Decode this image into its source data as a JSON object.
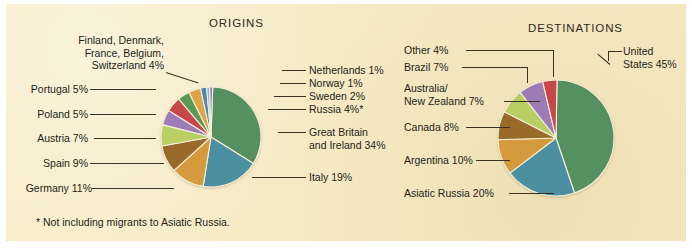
{
  "figure": {
    "background_color": "#f6e9c2",
    "text_color": "#241f18",
    "footnote": "* Not including migrants to Asiatic Russia."
  },
  "panels": {
    "origins": {
      "title": "ORIGINS",
      "labels": {
        "nordic_group": "Finland, Denmark,\nFrance, Belgium,\nSwitzerland  4%",
        "nordic_group_l1": "Finland, Denmark,",
        "nordic_group_l2": "France, Belgium,",
        "nordic_group_l3": "Switzerland  4%",
        "portugal": "Portugal  5%",
        "poland": "Poland  5%",
        "austria": "Austria  7%",
        "spain": "Spain  9%",
        "germany": "Germany  11%",
        "netherlands": "Netherlands  1%",
        "norway": "Norway  1%",
        "sweden": "Sweden  2%",
        "russia": "Russia  4%*",
        "great_britain_l1": "Great Britain",
        "great_britain_l2": "and Ireland  34%",
        "italy": "Italy  19%"
      }
    },
    "destinations": {
      "title": "DESTINATIONS",
      "labels": {
        "other": "Other  4%",
        "brazil": "Brazil  7%",
        "australia_nz_l1": "Australia/",
        "australia_nz_l2": "New Zealand  7%",
        "canada": "Canada  8%",
        "argentina": "Argentina  10%",
        "asiatic_russia": "Asiatic Russia  20%",
        "united_states_l1": "United",
        "united_states_l2": "States 45%"
      }
    }
  },
  "chart_data": [
    {
      "type": "pie",
      "title": "ORIGINS",
      "id": "origins",
      "unit": "percent",
      "legend_position": "leader-lines",
      "note": "* Not including migrants to Asiatic Russia.",
      "categories": [
        "Great Britain and Ireland",
        "Italy",
        "Germany",
        "Spain",
        "Austria",
        "Poland",
        "Portugal",
        "Finland, Denmark, France, Belgium, Switzerland",
        "Russia",
        "Sweden",
        "Norway",
        "Netherlands"
      ],
      "values": [
        34,
        19,
        11,
        9,
        7,
        5,
        5,
        4,
        4,
        2,
        1,
        1
      ],
      "colors": [
        "#559160",
        "#4b8fa0",
        "#d59a3e",
        "#9a6a2a",
        "#b9cf63",
        "#9d7bb5",
        "#c8474b",
        "#5c9b57",
        "#e0a446",
        "#4e86b5",
        "#86bcd8",
        "#9b79c0"
      ],
      "labels": [
        "Great Britain and Ireland  34%",
        "Italy  19%",
        "Germany  11%",
        "Spain  9%",
        "Austria  7%",
        "Poland  5%",
        "Portugal  5%",
        "Finland, Denmark, France, Belgium, Switzerland  4%",
        "Russia  4%*",
        "Sweden  2%",
        "Norway  1%",
        "Netherlands  1%"
      ]
    },
    {
      "type": "pie",
      "title": "DESTINATIONS",
      "id": "destinations",
      "unit": "percent",
      "legend_position": "leader-lines",
      "categories": [
        "United States",
        "Asiatic Russia",
        "Argentina",
        "Canada",
        "Australia/New Zealand",
        "Brazil",
        "Other"
      ],
      "values": [
        45,
        20,
        10,
        8,
        7,
        7,
        4
      ],
      "colors": [
        "#559160",
        "#4b8fa0",
        "#d59a3e",
        "#9a6a2a",
        "#b9cf63",
        "#9d7bb5",
        "#c8474b"
      ],
      "labels": [
        "United States 45%",
        "Asiatic Russia  20%",
        "Argentina  10%",
        "Canada  8%",
        "Australia/New Zealand  7%",
        "Brazil  7%",
        "Other  4%"
      ]
    }
  ]
}
